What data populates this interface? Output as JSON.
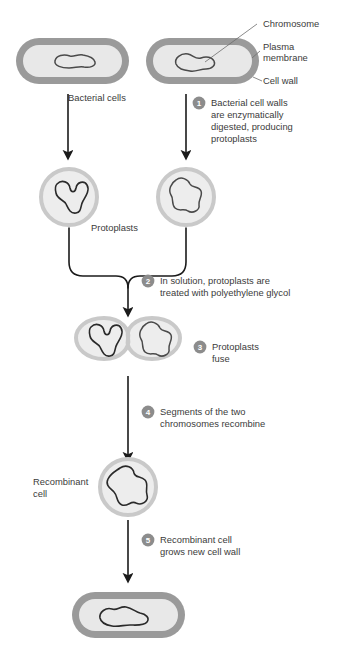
{
  "figure": {
    "background_color": "#ffffff"
  },
  "colors": {
    "cell_wall": "#9a9a9a",
    "cytoplasm": "#e8e8e8",
    "protoplast_ring": "#c9c9c9",
    "protoplast_fill": "#ededed",
    "chromosome_stroke": "#4a4a4a",
    "arrow": "#1b1b1b",
    "badge_fill": "#8c8c8c",
    "badge_text": "#ffffff",
    "text": "#3b3b3b",
    "leader": "#6d6d6d"
  },
  "callouts": [
    {
      "id": "chromosome",
      "label": "Chromosome"
    },
    {
      "id": "plasma-membrane",
      "label_line1": "Plasma",
      "label_line2": "membrane"
    },
    {
      "id": "cell-wall",
      "label": "Cell wall"
    }
  ],
  "labels": {
    "bacterial_cells": "Bacterial cells",
    "protoplasts": "Protoplasts",
    "recombinant_cell_line1": "Recombinant",
    "recombinant_cell_line2": "cell"
  },
  "steps": [
    {
      "number": "1",
      "lines": [
        "Bacterial cell walls",
        "are enzymatically",
        "digested, producing",
        "protoplasts"
      ]
    },
    {
      "number": "2",
      "lines": [
        "In solution, protoplasts are",
        "treated with polyethylene glycol"
      ]
    },
    {
      "number": "3",
      "lines": [
        "Protoplasts",
        "fuse"
      ]
    },
    {
      "number": "4",
      "lines": [
        "Segments of the two",
        "chromosomes recombine"
      ]
    },
    {
      "number": "5",
      "lines": [
        "Recombinant cell",
        "grows new cell wall"
      ]
    }
  ]
}
